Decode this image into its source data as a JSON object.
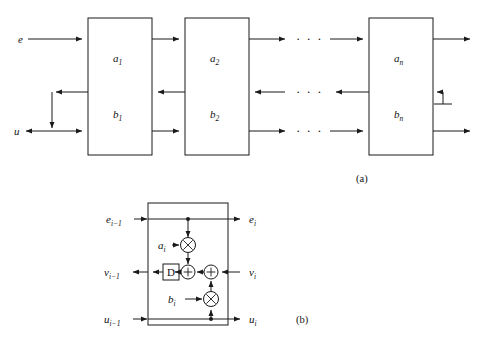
{
  "figure": {
    "type": "signal-flow-block-diagram",
    "panels": [
      {
        "id": "a",
        "caption": "(a)",
        "inputs": [
          {
            "name": "e-input-label",
            "text": "e",
            "row": "top"
          },
          {
            "name": "u-input-label",
            "text": "u",
            "row": "bottom"
          }
        ],
        "sections": [
          {
            "top_label": "a",
            "top_sub": "1",
            "bottom_label": "b",
            "bottom_sub": "1"
          },
          {
            "top_label": "a",
            "top_sub": "2",
            "bottom_label": "b",
            "bottom_sub": "2"
          },
          {
            "top_label": "a",
            "top_sub": "n",
            "bottom_label": "b",
            "bottom_sub": "n"
          }
        ],
        "ellipsis": "· · ·",
        "ellipsis_rows": 3,
        "termination": "ground-symbol"
      },
      {
        "id": "b",
        "caption": "(b)",
        "ports": [
          {
            "name": "e-in",
            "text": "e",
            "sub": "i−1",
            "side": "left",
            "row": "top"
          },
          {
            "name": "e-out",
            "text": "e",
            "sub": "i",
            "side": "right",
            "row": "top"
          },
          {
            "name": "v-out",
            "text": "v",
            "sub": "i−1",
            "side": "left",
            "row": "middle"
          },
          {
            "name": "v-in",
            "text": "v",
            "sub": "i",
            "side": "right",
            "row": "middle"
          },
          {
            "name": "u-in",
            "text": "u",
            "sub": "i−1",
            "side": "left",
            "row": "bottom"
          },
          {
            "name": "u-out",
            "text": "u",
            "sub": "i",
            "side": "right",
            "row": "bottom"
          }
        ],
        "coefficients": [
          {
            "name": "coefficient-a",
            "text": "a",
            "sub": "i"
          },
          {
            "name": "coefficient-b",
            "text": "b",
            "sub": "i"
          }
        ],
        "elements": [
          {
            "name": "delay-element",
            "symbol": "D",
            "kind": "box"
          },
          {
            "name": "multiplier-a",
            "symbol": "×",
            "kind": "circle"
          },
          {
            "name": "multiplier-b",
            "symbol": "×",
            "kind": "circle"
          },
          {
            "name": "adder-left",
            "symbol": "+",
            "kind": "circle"
          },
          {
            "name": "adder-right",
            "symbol": "+",
            "kind": "circle"
          }
        ]
      }
    ]
  },
  "colors": {
    "ink": "#1a1a1a",
    "paper": "#ffffff"
  }
}
